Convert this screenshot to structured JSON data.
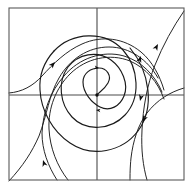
{
  "figure": {
    "title": "",
    "kind": "phase-portrait",
    "width": 193,
    "height": 189,
    "background_color": "#ffffff"
  },
  "colors": {
    "frame": "#5a5a5a",
    "axis": "#4a4a4a",
    "trajectory": "#1a1a1a",
    "arrow": "#0d0d0d"
  },
  "frame": {
    "x": 9,
    "y": 8,
    "width": 175,
    "height": 172,
    "stroke_width": 1.1
  },
  "axes": {
    "origin_x": 97,
    "origin_y": 95,
    "horizontal": {
      "x1": 9,
      "y1": 95,
      "x2": 184,
      "y2": 95
    },
    "vertical": {
      "x1": 97,
      "y1": 8,
      "x2": 97,
      "y2": 180
    },
    "x_tick_labels": [],
    "y_tick_labels": [],
    "xlabel": "",
    "ylabel": "",
    "grid": false
  },
  "chart_data": {
    "type": "line",
    "title": "",
    "xlabel": "",
    "ylabel": "",
    "xlim": [
      9,
      184
    ],
    "ylim": [
      180,
      8
    ],
    "grid": false,
    "legend": null,
    "equilibrium": {
      "x": 97,
      "y": 95,
      "kind": "spiral-sink",
      "stability": "stable"
    },
    "series": [
      {
        "name": "inner-spiral-core",
        "kind": "spiral",
        "path": "M 97 95 C 99 92 104 90 108 83 C 112 76 107 68 99 68 C 91 68 83 73 83 82 C 83 93 92 103 100 107 C 110 112 120 106 124 96 C 129 84 122 68 111 60 C 97 50 78 54 68 67 C 57 82 60 104 72 117 C 86 132 111 130 125 115 C 141 98 139 68 123 50 C 105 30 72 32 54 51"
      },
      {
        "name": "outer-spiral-left-branch",
        "kind": "spiral",
        "path": "M 54 51 C 44 62 39 76 40 90 C 41 110 52 131 70 143 C 92 158 122 152 138 131 C 155 108 150 72 130 48"
      },
      {
        "name": "trajectory-upper-left-entry",
        "kind": "trajectory",
        "path": "M 9 93 C 22 92 33 86 42 76 C 53 64 66 51 82 44 C 102 35 124 38 141 52 C 152 61 160 76 164 90"
      },
      {
        "name": "trajectory-left-lower-loop",
        "kind": "trajectory",
        "path": "M 9 181 C 23 166 32 152 39 136 C 47 115 49 95 59 78 C 70 59 88 47 109 47 C 130 47 148 60 158 78"
      },
      {
        "name": "trajectory-lower-left-sweep",
        "kind": "trajectory",
        "path": "M 57 180 C 48 166 42 150 42 133 C 43 112 50 92 64 76 C 79 58 103 50 124 56 C 141 61 155 75 162 92"
      },
      {
        "name": "trajectory-bottom-wide",
        "kind": "trajectory",
        "path": "M 68 180 C 57 166 50 148 49 129 C 48 108 56 88 70 74 C 86 58 110 53 130 61 C 146 68 158 82 164 99"
      },
      {
        "name": "trajectory-right-upper-exit",
        "kind": "trajectory",
        "path": "M 184 11 C 173 27 163 45 155 65 C 147 85 143 108 142 130 C 141 150 143 166 147 180"
      },
      {
        "name": "trajectory-right-lower-exit",
        "kind": "trajectory",
        "path": "M 184 88 C 170 92 157 100 147 113 C 138 125 133 141 131 158 C 130 168 130 175 130 180"
      }
    ],
    "arrows": [
      {
        "name": "arrow-upper-left",
        "x": 55,
        "y": 62,
        "angle_deg": -48,
        "size": 6.5,
        "direction": "up-right"
      },
      {
        "name": "arrow-lower-left",
        "x": 43,
        "y": 160,
        "angle_deg": -108,
        "size": 6.5,
        "direction": "up-left"
      },
      {
        "name": "arrow-top-right-inner",
        "x": 141,
        "y": 56,
        "angle_deg": -70,
        "size": 6.5,
        "direction": "up"
      },
      {
        "name": "arrow-top-right-outer",
        "x": 158,
        "y": 44,
        "angle_deg": -62,
        "size": 6.5,
        "direction": "up-right"
      },
      {
        "name": "arrow-right-middle-upper",
        "x": 140,
        "y": 101,
        "angle_deg": 104,
        "size": 6.5,
        "direction": "down"
      },
      {
        "name": "arrow-right-middle-lower",
        "x": 143,
        "y": 122,
        "angle_deg": 112,
        "size": 6.5,
        "direction": "down"
      },
      {
        "name": "arrow-center-upper",
        "x": 99,
        "y": 68,
        "angle_deg": 8,
        "size": 4.5,
        "direction": "right"
      },
      {
        "name": "arrow-center-lower",
        "x": 96,
        "y": 110,
        "angle_deg": 186,
        "size": 4.5,
        "direction": "left"
      }
    ]
  }
}
